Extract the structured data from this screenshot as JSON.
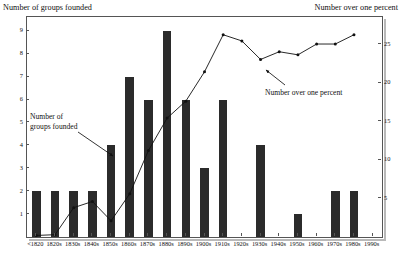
{
  "chart_data": {
    "type": "bar",
    "title": "",
    "categories": [
      "<1820",
      "1820s",
      "1830s",
      "1840s",
      "1850s",
      "1860s",
      "1870s",
      "1880s",
      "1890s",
      "1900s",
      "1910s",
      "1920s",
      "1930s",
      "1940s",
      "1950s",
      "1960s",
      "1970s",
      "1980s",
      "1990s"
    ],
    "series": [
      {
        "name": "Number of groups founded",
        "type": "bar",
        "axis": "left",
        "values": [
          2,
          2,
          2,
          2,
          4,
          7,
          6,
          9,
          6,
          3,
          6,
          0,
          4,
          0,
          1,
          0,
          2,
          2,
          0
        ]
      },
      {
        "name": "Number over one percent",
        "type": "line",
        "axis": "right",
        "values": [
          0.2,
          0.3,
          3.8,
          4.6,
          2.1,
          5.6,
          11.2,
          15.4,
          17.6,
          21.4,
          26.2,
          25.4,
          23.0,
          24.0,
          23.6,
          25.0,
          25.0,
          26.2,
          null
        ]
      }
    ],
    "xlabel": "",
    "ylabel_left": "Number of groups founded",
    "ylabel_right": "Number over one percent",
    "yticks_left": [
      1,
      2,
      3,
      4,
      5,
      6,
      7,
      8,
      9
    ],
    "yticks_right": [
      5,
      10,
      15,
      20,
      25
    ],
    "ylim_left": [
      0,
      9.6
    ],
    "ylim_right": [
      0,
      28.5
    ],
    "grid": false,
    "legend_position": "inline-annotations",
    "annotations": [
      {
        "text_line1": "Number of",
        "text_line2": "groups founded",
        "points_to": "1850s bar"
      },
      {
        "text_line1": "Number over one percent",
        "text_line2": "",
        "points_to": "1940s line point"
      }
    ],
    "colors": {
      "bar": "#2b2b2b",
      "line": "#111111",
      "frame": "#555555",
      "background": "#ffffff"
    }
  },
  "axis_titles": {
    "left": "Number of groups founded",
    "right": "Number over one percent"
  },
  "annotations": {
    "bars": {
      "line1": "Number of",
      "line2": "groups founded"
    },
    "line": {
      "line1": "Number over one percent"
    }
  }
}
